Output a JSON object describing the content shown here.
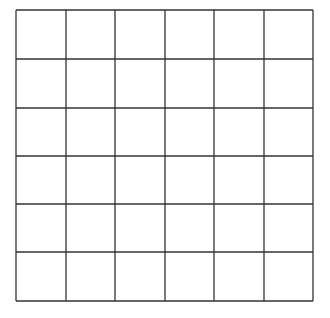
{
  "grid": {
    "rows": 6,
    "cols": 6,
    "x_lines": [
      16,
      66,
      115,
      165,
      214,
      264,
      313
    ],
    "y_lines": [
      10,
      59,
      108,
      156,
      204,
      252,
      301
    ],
    "line_color": "#333333",
    "line_width": 1.3,
    "background": "#ffffff"
  }
}
